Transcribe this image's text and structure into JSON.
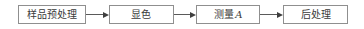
{
  "diagram": {
    "type": "flowchart",
    "direction": "left-to-right",
    "nodes": [
      {
        "id": "sample-pretreatment",
        "label": "样品预处理"
      },
      {
        "id": "color-development",
        "label": "显色"
      },
      {
        "id": "measure-absorbance",
        "label": "测量",
        "var": "A"
      },
      {
        "id": "post-processing",
        "label": "后处理"
      }
    ],
    "edges": [
      {
        "from": "sample-pretreatment",
        "to": "color-development",
        "style": "arrow"
      },
      {
        "from": "color-development",
        "to": "measure-absorbance",
        "style": "arrow"
      },
      {
        "from": "measure-absorbance",
        "to": "post-processing",
        "style": "arrow"
      }
    ],
    "colors": {
      "background": "#ffffff",
      "node_fill": "#ffffff",
      "node_border": "#8f8f8f",
      "text": "#3b3b3b",
      "arrow": "#3f3f3f"
    }
  }
}
